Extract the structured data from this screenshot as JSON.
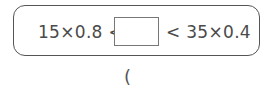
{
  "problem": {
    "left_expression": "15×0.8 <",
    "right_expression": "< 35×0.4",
    "answer_value": ""
  },
  "answer_paren": "("
}
